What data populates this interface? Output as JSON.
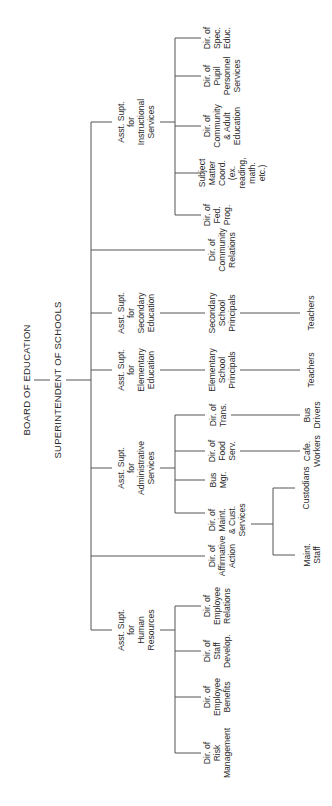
{
  "orientation": "rotated-90-ccw",
  "root": {
    "label": "BOARD OF EDUCATION"
  },
  "superintendent": {
    "label": "SUPERINTENDENT OF SCHOOLS"
  },
  "branches": [
    {
      "label": "Asst. Supt.\nfor\nInstructional\nServices",
      "children": [
        {
          "label": "Dir. of\nFed.\nProg."
        },
        {
          "label": "Subject\nMatter\nCoord.\n(ex.\nreading,\nmath.\netc.)"
        },
        {
          "label": "Dir. of\nCommunity\n& Adult\nEducation"
        },
        {
          "label": "Dir. of\nPupil\nPersonnel\nServices"
        },
        {
          "label": "Dir. of\nSpec.\nEduc."
        }
      ]
    },
    {
      "label": "Dir. of\nCommunity\nRelations"
    },
    {
      "label": "Asst. Supt.\nfor\nSecondary\nEducation",
      "children": [
        {
          "label": "Secondary\nSchool\nPrincipals",
          "children": [
            {
              "label": "Teachers"
            }
          ]
        }
      ]
    },
    {
      "label": "Asst. Supt.\nfor\nElementary\nEducation",
      "children": [
        {
          "label": "Elementary\nSchool\nPrincipals",
          "children": [
            {
              "label": "Teachers"
            }
          ]
        }
      ]
    },
    {
      "label": "Asst. Supt.\nfor\nAdministrative\nServices",
      "children": [
        {
          "label": "Dir. of\nMaint.\n& Cust.\nServices",
          "children": [
            {
              "label": "Maint.\nStaff"
            },
            {
              "label": "Custodians"
            }
          ]
        },
        {
          "label": "Bus\nMgr."
        },
        {
          "label": "Dir. of\nFood\nServ.",
          "children": [
            {
              "label": "Cafe.\nWorkers"
            }
          ]
        },
        {
          "label": "Dir. of\nTrans.",
          "children": [
            {
              "label": "Bus\nDrivers"
            }
          ]
        }
      ]
    },
    {
      "label": "Dir. of\nAffirmative\nAction"
    },
    {
      "label": "Asst. Supt.\nfor\nHuman\nResources",
      "children": [
        {
          "label": "Dir. of\nRisk\nManagement"
        },
        {
          "label": "Dir. of\nEmployee\nBenefits"
        },
        {
          "label": "Dir. of\nStaff\nDevelop."
        },
        {
          "label": "Dir. of\nEmployee\nRelations"
        }
      ]
    }
  ]
}
